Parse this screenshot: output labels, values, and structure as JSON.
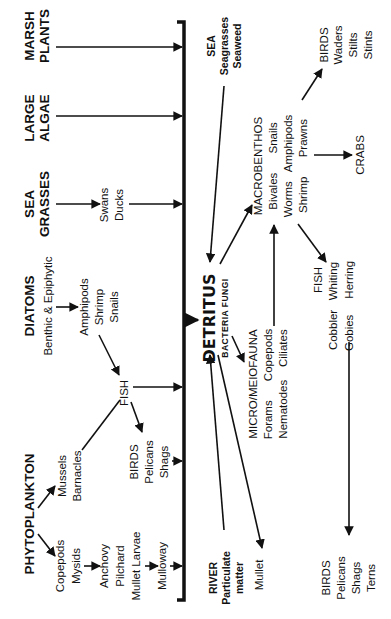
{
  "orientation": "rotated-90-ccw",
  "central_node": {
    "label": "DETRITUS",
    "sublabel": "BACTERIA FUNGI"
  },
  "producers": [
    {
      "id": "marsh",
      "lines": [
        "MARSH",
        "PLANTS"
      ]
    },
    {
      "id": "algae",
      "lines": [
        "LARGE",
        "ALGAE"
      ]
    },
    {
      "id": "seagrass",
      "lines": [
        "SEA",
        "GRASSES"
      ]
    },
    {
      "id": "diatoms",
      "lines": [
        "DIATOMS",
        "Benthic & Epiphytic"
      ]
    },
    {
      "id": "phyto",
      "lines": [
        "PHYTOPLANKTON"
      ]
    }
  ],
  "consumers_left": [
    {
      "id": "swans",
      "lines": [
        "Swans",
        "Ducks"
      ]
    },
    {
      "id": "amphipods1",
      "lines": [
        "Amphipods",
        "Shrimp",
        "Snails"
      ]
    },
    {
      "id": "fish1",
      "lines": [
        "FISH"
      ]
    },
    {
      "id": "mussels",
      "lines": [
        "Mussels",
        "Barnacles"
      ]
    },
    {
      "id": "birds1",
      "lines": [
        "BIRDS",
        "Pelicans",
        "Shags"
      ]
    },
    {
      "id": "copepods1",
      "lines": [
        "Copepods",
        "Mysids"
      ]
    },
    {
      "id": "anchovy",
      "lines": [
        "Anchovy",
        "Pilchard",
        "Mullet Larvae"
      ]
    },
    {
      "id": "mulloway",
      "lines": [
        "Mulloway"
      ]
    }
  ],
  "sources_right": [
    {
      "id": "sea",
      "lines": [
        "SEA",
        "Seagrasses",
        "Seaweed"
      ]
    },
    {
      "id": "river",
      "lines": [
        "RIVER",
        "Particulate",
        "matter"
      ]
    }
  ],
  "consumers_right": [
    {
      "id": "macro",
      "lines": [
        "MACROBENTHOS",
        "Bivales      Snails",
        "Worms   Amphipods",
        "Shrimp      Prawns"
      ]
    },
    {
      "id": "birds2",
      "lines": [
        "BIRDS",
        "Waders",
        "Stilts",
        "Stints"
      ]
    },
    {
      "id": "crabs",
      "lines": [
        "CRABS"
      ]
    },
    {
      "id": "micro",
      "lines": [
        "MICRO/MEIOFAUNA",
        "Forams      Copepods",
        "Nematodes    Ciliates"
      ]
    },
    {
      "id": "fish2",
      "lines": [
        "FISH",
        "Cobbler   Whiting",
        "Gobies     Herring"
      ]
    },
    {
      "id": "mullet",
      "lines": [
        "Mullet"
      ]
    },
    {
      "id": "birds3",
      "lines": [
        "BIRDS",
        "Pelicans",
        "Shags",
        "Terns"
      ]
    }
  ],
  "colors": {
    "ink": "#111111",
    "background": "#ffffff"
  }
}
